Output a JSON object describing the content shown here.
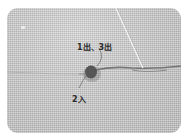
{
  "photo": {
    "subject": "embroidery-stitch-on-linen",
    "labels": {
      "out_points": "1出、3出",
      "in_point": "2入"
    },
    "colors": {
      "fabric": "#c9c9c9",
      "background": "#ffffff",
      "thread": "#6f6f6f",
      "knot": "#3a3a3a",
      "needle": "#f4f4f4",
      "label_text": "#2a2a2a"
    }
  }
}
